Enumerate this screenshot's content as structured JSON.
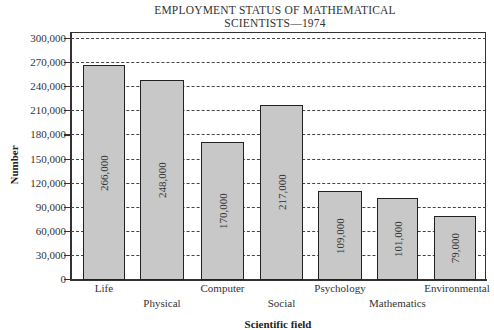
{
  "chart_data": {
    "type": "bar",
    "title": "EMPLOYMENT STATUS OF MATHEMATICAL SCIENTISTS—1974",
    "title_lines": [
      "EMPLOYMENT STATUS OF MATHEMATICAL",
      "SCIENTISTS—1974"
    ],
    "xlabel": "Scientific field",
    "ylabel": "Number",
    "categories": [
      "Life",
      "Physical",
      "Computer",
      "Social",
      "Psychology",
      "Mathematics",
      "Environmental"
    ],
    "values": [
      266000,
      248000,
      170000,
      217000,
      109000,
      101000,
      79000
    ],
    "value_labels": [
      "266,000",
      "248,000",
      "170,000",
      "217,000",
      "109,000",
      "101,000",
      "79,000"
    ],
    "ylim": [
      0,
      300000
    ],
    "yticks": [
      0,
      30000,
      60000,
      90000,
      120000,
      150000,
      180000,
      210000,
      240000,
      270000,
      300000
    ],
    "ytick_labels": [
      "0",
      "30,000",
      "60,000",
      "90,000",
      "120,000",
      "150,000",
      "180,000",
      "210,000",
      "240,000",
      "270,000",
      "300,000"
    ],
    "grid": "horizontal dashed",
    "legend": "none",
    "bar_color": "#c8c8c8"
  }
}
